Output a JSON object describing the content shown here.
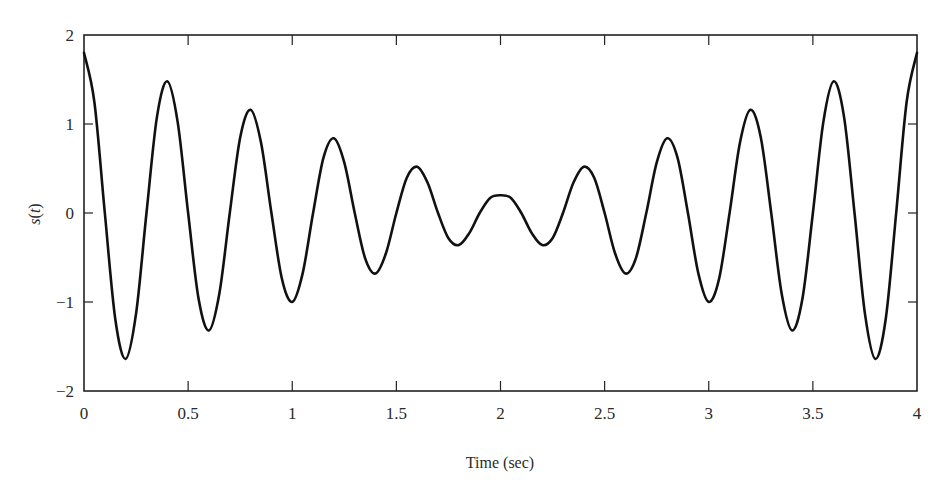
{
  "chart_data": {
    "type": "line",
    "title": "",
    "xlabel": "Time (sec)",
    "ylabel": "s(t)",
    "ylabel_parts": {
      "func": "s",
      "open": "(",
      "var": "t",
      "close": ")"
    },
    "xlim": [
      0,
      4
    ],
    "ylim": [
      -2,
      2
    ],
    "grid": false,
    "legend": null,
    "x_ticks": [
      0,
      0.5,
      1,
      1.5,
      2,
      2.5,
      3,
      3.5,
      4
    ],
    "x_tick_labels": [
      "0",
      "0.5",
      "1",
      "1.5",
      "2",
      "2.5",
      "3",
      "3.5",
      "4"
    ],
    "y_ticks": [
      -2,
      -1,
      0,
      1,
      2
    ],
    "y_tick_labels": [
      "−2",
      "−1",
      "0",
      "1",
      "2"
    ],
    "line_color": "#111111",
    "series": [
      {
        "name": "s(t)",
        "x_step": 0.05,
        "x_start": 0,
        "values": [
          1.8,
          1.2445,
          0,
          -1.1879,
          -1.64,
          -1.1314,
          0,
          1.0748,
          1.48,
          1.0182,
          0,
          -0.9617,
          -1.32,
          -0.9051,
          0,
          0.8485,
          1.16,
          0.792,
          0,
          -0.7354,
          -1.0,
          -0.6788,
          0,
          0.6223,
          0.84,
          0.5657,
          0,
          -0.5091,
          -0.68,
          -0.4525,
          0,
          0.396,
          0.52,
          0.3394,
          0,
          -0.2828,
          -0.36,
          -0.2263,
          0,
          0.1697,
          0.2,
          0.1697,
          0,
          -0.2263,
          -0.36,
          -0.2828,
          0,
          0.3394,
          0.52,
          0.396,
          0,
          -0.4525,
          -0.68,
          -0.5091,
          0,
          0.5657,
          0.84,
          0.6223,
          0,
          -0.6788,
          -1.0,
          -0.7354,
          0,
          0.792,
          1.16,
          0.8485,
          0,
          -0.9051,
          -1.32,
          -0.9617,
          0,
          1.0182,
          1.48,
          1.0748,
          0,
          -1.1314,
          -1.64,
          -1.1879,
          0,
          1.2445,
          1.8
        ]
      }
    ],
    "extrema_observed": [
      {
        "t": 0.0,
        "s": 1.76
      },
      {
        "t": 0.2,
        "s": -1.61
      },
      {
        "t": 0.4,
        "s": 1.47
      },
      {
        "t": 0.6,
        "s": -1.29
      },
      {
        "t": 0.8,
        "s": 1.16
      },
      {
        "t": 1.0,
        "s": -0.98
      },
      {
        "t": 1.2,
        "s": 0.87
      },
      {
        "t": 1.4,
        "s": -0.65
      },
      {
        "t": 1.6,
        "s": 0.54
      },
      {
        "t": 1.8,
        "s": -0.32
      },
      {
        "t": 2.0,
        "s": 0.22
      },
      {
        "t": 2.2,
        "s": -0.32
      },
      {
        "t": 2.4,
        "s": 0.54
      },
      {
        "t": 2.6,
        "s": -0.63
      },
      {
        "t": 2.8,
        "s": 0.87
      },
      {
        "t": 3.0,
        "s": -0.94
      },
      {
        "t": 3.2,
        "s": 1.18
      },
      {
        "t": 3.4,
        "s": -1.26
      },
      {
        "t": 3.6,
        "s": 1.49
      },
      {
        "t": 3.8,
        "s": -1.58
      },
      {
        "t": 4.0,
        "s": 1.8
      }
    ]
  }
}
